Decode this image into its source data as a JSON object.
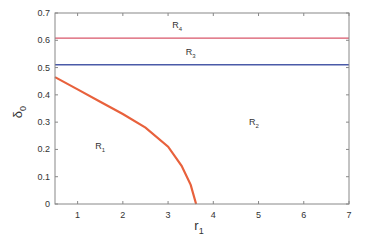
{
  "chart_data": {
    "type": "line",
    "title": "",
    "xlabel": "r",
    "xlabel_sub": "1",
    "ylabel": "δ",
    "ylabel_sub": "0",
    "xlim": [
      0.5,
      7
    ],
    "ylim": [
      0,
      0.7
    ],
    "xticks": [
      1,
      2,
      3,
      4,
      5,
      6,
      7
    ],
    "yticks": [
      0,
      0.1,
      0.2,
      0.3,
      0.4,
      0.5,
      0.6,
      0.7
    ],
    "ytick_labels": [
      "0",
      "0.1",
      "0.2",
      "0.3",
      "0.4",
      "0.5",
      "0.6",
      "0.7"
    ],
    "grid": false,
    "series": [
      {
        "name": "boundary R1/R2",
        "color": "#e8613c",
        "x": [
          0.5,
          1.0,
          1.5,
          2.0,
          2.5,
          3.0,
          3.3,
          3.5,
          3.62
        ],
        "y": [
          0.465,
          0.42,
          0.375,
          0.33,
          0.28,
          0.21,
          0.14,
          0.07,
          0.0
        ]
      },
      {
        "name": "boundary R2/R3",
        "color": "#4a5aa8",
        "x": [
          0.5,
          7
        ],
        "y": [
          0.51,
          0.51
        ]
      },
      {
        "name": "boundary R3/R4",
        "color": "#d9566a",
        "x": [
          0.5,
          7
        ],
        "y": [
          0.608,
          0.608
        ]
      }
    ],
    "annotations": [
      {
        "text": "R",
        "sub": "1",
        "x": 1.5,
        "y": 0.2
      },
      {
        "text": "R",
        "sub": "2",
        "x": 4.9,
        "y": 0.29
      },
      {
        "text": "R",
        "sub": "3",
        "x": 3.5,
        "y": 0.545
      },
      {
        "text": "R",
        "sub": "4",
        "x": 3.2,
        "y": 0.645
      }
    ]
  }
}
